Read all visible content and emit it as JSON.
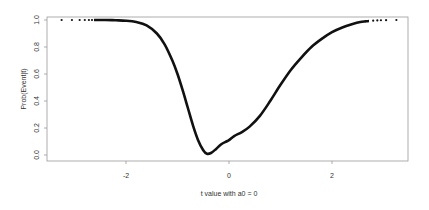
{
  "chart_data": {
    "type": "line",
    "title": "",
    "xlabel": "t value with a0 = 0",
    "ylabel": "Prob(Event|t)",
    "xlim": [
      -3.45,
      3.6
    ],
    "ylim": [
      -0.04,
      1.04
    ],
    "grid": false,
    "legend": null,
    "x_ticks": [
      -2,
      0,
      2
    ],
    "x_tick_labels": [
      "-2",
      "0",
      "2"
    ],
    "y_ticks": [
      0.0,
      0.2,
      0.4,
      0.6,
      0.8,
      1.0
    ],
    "y_tick_labels": [
      "0.0",
      "0.2",
      "0.4",
      "0.6",
      "0.8",
      "1.0"
    ],
    "series": [
      {
        "name": "Prob(Event|t)",
        "style": "dense-points-forming-curve",
        "color": "#111111",
        "x": [
          -3.25,
          -3.05,
          -2.9,
          -2.8,
          -2.72,
          -2.66,
          -2.6,
          -2.55,
          -2.5,
          -2.4,
          -2.2,
          -2.0,
          -1.8,
          -1.6,
          -1.4,
          -1.25,
          -1.1,
          -1.0,
          -0.9,
          -0.8,
          -0.7,
          -0.6,
          -0.5,
          -0.43,
          -0.35,
          -0.25,
          -0.15,
          -0.05,
          0.0,
          0.1,
          0.25,
          0.4,
          0.6,
          0.8,
          1.0,
          1.2,
          1.4,
          1.6,
          1.8,
          2.0,
          2.2,
          2.4,
          2.55,
          2.65,
          2.72,
          2.8,
          2.88,
          2.95,
          3.05,
          3.25
        ],
        "y": [
          1.0,
          1.0,
          1.0,
          1.0,
          1.0,
          1.0,
          1.0,
          1.0,
          1.0,
          1.0,
          0.998,
          0.995,
          0.985,
          0.96,
          0.9,
          0.82,
          0.7,
          0.6,
          0.48,
          0.35,
          0.22,
          0.11,
          0.035,
          0.01,
          0.015,
          0.045,
          0.08,
          0.1,
          0.11,
          0.14,
          0.17,
          0.21,
          0.29,
          0.4,
          0.52,
          0.63,
          0.72,
          0.8,
          0.86,
          0.91,
          0.945,
          0.97,
          0.985,
          0.99,
          0.993,
          0.995,
          0.997,
          0.998,
          0.999,
          1.0
        ]
      }
    ]
  }
}
